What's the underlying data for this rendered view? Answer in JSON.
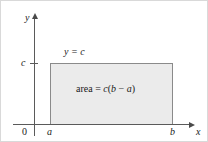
{
  "figure": {
    "background_color": "#ffffff",
    "axis_color": "#5a5a5a",
    "fill_color": "#ebebeb",
    "rect_border_color": "#8a8a8a"
  },
  "axes": {
    "y_axis_label": "y",
    "x_axis_label": "x",
    "origin_label": "0",
    "y_tick_label": "c",
    "x_tick_left_label": "a",
    "x_tick_right_label": "b"
  },
  "annotations": {
    "curve_label": "y = c",
    "area_prefix": "area = ",
    "area_c": "c",
    "area_open": "(",
    "area_b": "b",
    "area_minus": " − ",
    "area_a": "a",
    "area_close": ")",
    "area_full": "area = c(b − a)"
  },
  "chart_data": {
    "type": "area",
    "title": "",
    "xlabel": "x",
    "ylabel": "y",
    "grid": false,
    "legend": "none",
    "x": [
      "a",
      "b"
    ],
    "values": [
      "c",
      "c"
    ],
    "series": [
      {
        "name": "y = c",
        "values": [
          "c",
          "c"
        ]
      }
    ],
    "shaded_region": {
      "x_from": "a",
      "x_to": "b",
      "y_from": 0,
      "y_to": "c",
      "label": "area = c(b − a)",
      "fill": "#ebebeb"
    },
    "xlim": [
      "0",
      "b"
    ],
    "ylim": [
      0,
      "c"
    ],
    "tick_labels_x": [
      "0",
      "a",
      "b"
    ],
    "tick_labels_y": [
      "c"
    ]
  }
}
